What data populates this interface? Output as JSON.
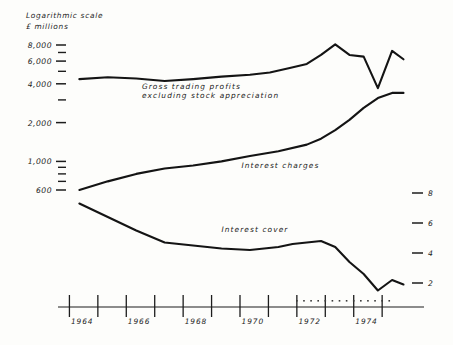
{
  "chart_data": {
    "type": "line",
    "title": "",
    "subtitle": "",
    "axis_title_line1": "Logarithmic scale",
    "axis_title_line2": "£ millions",
    "ylabel": "£ millions",
    "xlabel": "",
    "scale": "logarithmic",
    "grid": false,
    "legend_position": "inline-annotations",
    "ylim_left": [
      500,
      9000
    ],
    "left_axis_ticks": [
      "8,000",
      "6,000",
      "4,000",
      "2,000",
      "1,000",
      "600"
    ],
    "left_axis_tick_values": [
      8000,
      6000,
      4000,
      2000,
      1000,
      600
    ],
    "left_axis_minor_ticks": [
      7000,
      5000,
      3000,
      900,
      800,
      700
    ],
    "ylim_right": [
      1,
      9
    ],
    "right_axis_ticks": [
      "8",
      "6",
      "4",
      "2"
    ],
    "right_axis_tick_values": [
      8,
      6,
      4,
      2
    ],
    "x_tick_labels": [
      "1964",
      "1966",
      "1968",
      "1970",
      "1972",
      "1974"
    ],
    "x_tick_values": [
      1964,
      1966,
      1968,
      1970,
      1972,
      1974
    ],
    "x_minor_tick_values": [
      1965,
      1967,
      1969,
      1971,
      1973,
      1975
    ],
    "xlim": [
      1963.5,
      1975.6
    ],
    "series": [
      {
        "name": "Gross trading profits excluding stock appreciation",
        "label": "Gross trading profits",
        "label_line2": "excluding stock appreciation",
        "axis": "left",
        "unit": "£ millions",
        "color": "#141414",
        "x": [
          1963.9,
          1964.9,
          1965.9,
          1966.9,
          1967.9,
          1968.9,
          1969.9,
          1970.6,
          1971.3,
          1971.9,
          1972.4,
          1972.9,
          1973.4,
          1973.9,
          1974.4,
          1974.9,
          1975.3
        ],
        "values": [
          4350,
          4500,
          4400,
          4200,
          4350,
          4550,
          4700,
          4900,
          5300,
          5700,
          6700,
          8100,
          6700,
          6500,
          3700,
          7200,
          6200
        ]
      },
      {
        "name": "Interest charges",
        "label": "Interest charges",
        "axis": "left",
        "unit": "£ millions",
        "color": "#141414",
        "x": [
          1963.9,
          1964.9,
          1965.9,
          1966.9,
          1967.9,
          1968.9,
          1969.9,
          1970.9,
          1971.9,
          1972.4,
          1972.9,
          1973.4,
          1973.9,
          1974.4,
          1974.9,
          1975.3
        ],
        "values": [
          600,
          700,
          800,
          880,
          930,
          1000,
          1100,
          1200,
          1350,
          1500,
          1750,
          2100,
          2600,
          3100,
          3400,
          3400
        ]
      },
      {
        "name": "Interest cover",
        "label": "Interest cover",
        "axis": "right",
        "unit": "times",
        "color": "#141414",
        "x": [
          1963.9,
          1964.9,
          1965.9,
          1966.9,
          1967.9,
          1968.9,
          1969.9,
          1970.9,
          1971.4,
          1971.9,
          1972.4,
          1972.9,
          1973.4,
          1973.9,
          1974.4,
          1974.9,
          1975.3
        ],
        "values": [
          7.3,
          6.4,
          5.5,
          4.7,
          4.5,
          4.3,
          4.2,
          4.4,
          4.6,
          4.7,
          4.8,
          4.4,
          3.4,
          2.6,
          1.5,
          2.2,
          1.9
        ]
      }
    ],
    "annotations": [
      {
        "text": "Gross trading profits",
        "x": 1966.1,
        "y_px": 89
      },
      {
        "text": "excluding stock appreciation",
        "x": 1966.1,
        "y_px": 98
      },
      {
        "text": "Interest charges",
        "x": 1969.6,
        "y_px": 168
      },
      {
        "text": "Interest cover",
        "x": 1968.9,
        "y_px": 232
      }
    ]
  }
}
